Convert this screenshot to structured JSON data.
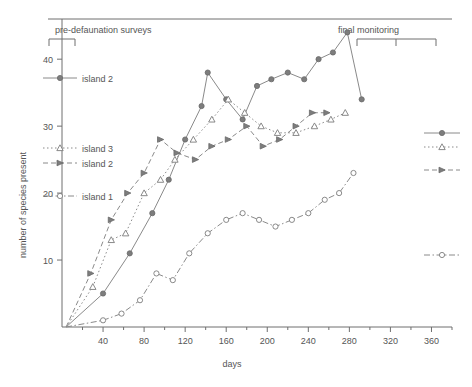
{
  "chart_data": {
    "type": "line",
    "title": "",
    "xlabel": "days",
    "ylabel": "number of species present",
    "xlim": [
      0,
      380
    ],
    "ylim": [
      0,
      46
    ],
    "xticks": [
      40,
      80,
      120,
      160,
      200,
      240,
      280,
      320,
      360
    ],
    "yticks": [
      10,
      20,
      30,
      40
    ],
    "grid": false,
    "legend_position": "inside-left",
    "annotations": [
      {
        "text": "pre-defaunation surveys",
        "x": 10,
        "y": 45
      },
      {
        "text": "final monitoring",
        "x": 300,
        "y": 45
      }
    ],
    "series": [
      {
        "name": "island 2 solid",
        "label": "island 2",
        "marker": "filled-circle",
        "linestyle": "solid",
        "points": [
          [
            4,
            0
          ],
          [
            40,
            5
          ],
          [
            66,
            11
          ],
          [
            88,
            17
          ],
          [
            104,
            22
          ],
          [
            120,
            28
          ],
          [
            136,
            33
          ],
          [
            142,
            38
          ],
          [
            160,
            34
          ],
          [
            176,
            31
          ],
          [
            190,
            36
          ],
          [
            204,
            37
          ],
          [
            220,
            38
          ],
          [
            236,
            37
          ],
          [
            250,
            40
          ],
          [
            264,
            41
          ],
          [
            278,
            44
          ],
          [
            292,
            34
          ]
        ]
      },
      {
        "name": "island 3",
        "label": "island 3",
        "marker": "open-triangle",
        "linestyle": "dotted",
        "points": [
          [
            4,
            0
          ],
          [
            30,
            6
          ],
          [
            48,
            13
          ],
          [
            62,
            14
          ],
          [
            80,
            20
          ],
          [
            96,
            22
          ],
          [
            110,
            25
          ],
          [
            128,
            28
          ],
          [
            146,
            31
          ],
          [
            162,
            34
          ],
          [
            178,
            32
          ],
          [
            194,
            30
          ],
          [
            210,
            29
          ],
          [
            228,
            29
          ],
          [
            246,
            30
          ],
          [
            262,
            31
          ],
          [
            276,
            32
          ]
        ]
      },
      {
        "name": "island 2 dashed",
        "label": "island 2",
        "marker": "filled-triangle",
        "linestyle": "dashed",
        "points": [
          [
            4,
            0
          ],
          [
            28,
            8
          ],
          [
            48,
            16
          ],
          [
            64,
            20
          ],
          [
            80,
            23
          ],
          [
            96,
            28
          ],
          [
            112,
            26
          ],
          [
            130,
            25
          ],
          [
            146,
            27
          ],
          [
            162,
            28
          ],
          [
            180,
            30
          ],
          [
            196,
            27
          ],
          [
            212,
            28
          ],
          [
            228,
            30
          ],
          [
            244,
            32
          ],
          [
            258,
            32
          ]
        ]
      },
      {
        "name": "island 1",
        "label": "island 1",
        "marker": "open-circle",
        "linestyle": "dash-dot",
        "points": [
          [
            4,
            0
          ],
          [
            40,
            1
          ],
          [
            58,
            2
          ],
          [
            76,
            4
          ],
          [
            92,
            8
          ],
          [
            108,
            7
          ],
          [
            124,
            11
          ],
          [
            142,
            14
          ],
          [
            160,
            16
          ],
          [
            176,
            17
          ],
          [
            192,
            16
          ],
          [
            208,
            15
          ],
          [
            224,
            16
          ],
          [
            240,
            17
          ],
          [
            256,
            19
          ],
          [
            270,
            20
          ],
          [
            284,
            23
          ]
        ]
      }
    ]
  },
  "legend_left": {
    "entries": [
      {
        "label": "island 2",
        "marker": "filled-circle",
        "linestyle": "solid"
      },
      {
        "label": "island 3",
        "marker": "open-triangle",
        "linestyle": "dotted"
      },
      {
        "label": "island 2",
        "marker": "filled-triangle",
        "linestyle": "dashed"
      },
      {
        "label": "island 1",
        "marker": "open-circle",
        "linestyle": "dash-dot"
      }
    ]
  },
  "legend_right": {
    "entries": [
      {
        "marker": "filled-circle",
        "linestyle": "solid"
      },
      {
        "marker": "open-triangle",
        "linestyle": "dotted"
      },
      {
        "marker": "filled-triangle",
        "linestyle": "dashed"
      },
      {
        "marker": "open-circle",
        "linestyle": "dash-dot"
      }
    ]
  },
  "colors": {
    "line": "#8a8a8a",
    "axis": "#6f6f6f",
    "text": "#555555",
    "background": "#ffffff"
  }
}
